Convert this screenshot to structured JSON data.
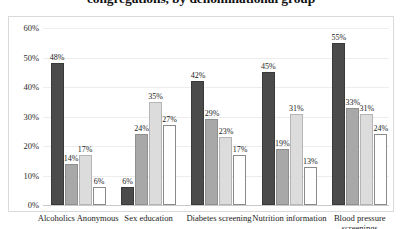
{
  "chart_data": {
    "type": "bar",
    "title": "congregations, by denominational group",
    "xlabel": "",
    "ylabel": "",
    "ylim": [
      0,
      60
    ],
    "ytick_labels": [
      "0%",
      "10%",
      "20%",
      "30%",
      "40%",
      "50%",
      "60%"
    ],
    "ytick_values": [
      0,
      10,
      20,
      30,
      40,
      50,
      60
    ],
    "grid": true,
    "legend": "none",
    "categories": [
      "Alcoholics Anonymous",
      "Sex education",
      "Diabetes screening",
      "Nutrition information",
      "Blood pressure screenings"
    ],
    "series": [
      {
        "name": "series-1",
        "color": "#4b4b4b",
        "values": [
          48,
          6,
          42,
          45,
          55
        ]
      },
      {
        "name": "series-2",
        "color": "#a8a8a8",
        "values": [
          14,
          24,
          29,
          19,
          33
        ]
      },
      {
        "name": "series-3",
        "color": "#dcdcdc",
        "values": [
          17,
          35,
          23,
          31,
          31
        ]
      },
      {
        "name": "series-4",
        "color": "#ffffff",
        "values": [
          6,
          27,
          17,
          13,
          24
        ]
      }
    ],
    "data_labels": [
      [
        "48%",
        "14%",
        "17%",
        "6%"
      ],
      [
        "6%",
        "24%",
        "35%",
        "27%"
      ],
      [
        "42%",
        "29%",
        "23%",
        "17%"
      ],
      [
        "45%",
        "19%",
        "31%",
        "13%"
      ],
      [
        "55%",
        "33%",
        "31%",
        "24%"
      ]
    ]
  }
}
